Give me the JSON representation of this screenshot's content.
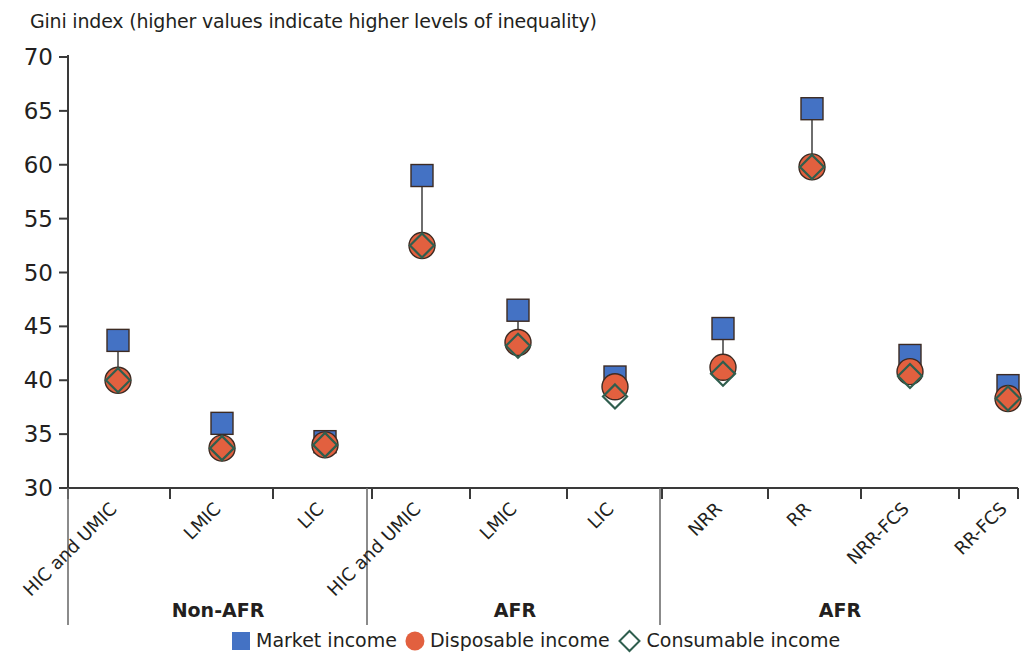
{
  "title": "Gini index (higher values indicate higher levels of inequality)",
  "legend": [
    {
      "label": "Market income",
      "marker": "square",
      "color": "#4472c4"
    },
    {
      "label": "Disposable income",
      "marker": "circle",
      "color": "#e2603f"
    },
    {
      "label": "Consumable income",
      "marker": "diamond",
      "color": "#ffffff"
    }
  ],
  "group_labels": [
    "Non-AFR",
    "AFR",
    "AFR"
  ],
  "axis": {
    "y_ticks": [
      "70",
      "65",
      "60",
      "55",
      "50",
      "45",
      "40",
      "35",
      "30"
    ],
    "y_min": 30,
    "y_max": 70
  },
  "chart_data": {
    "type": "scatter",
    "title": "Gini index (higher values indicate higher levels of inequality)",
    "xlabel": "",
    "ylabel": "Gini index",
    "ylim": [
      30,
      70
    ],
    "grid": false,
    "legend_position": "bottom",
    "categories": [
      "HIC and UMIC",
      "LMIC",
      "LIC",
      "HIC and UMIC",
      "LMIC",
      "LIC",
      "NRR",
      "RR",
      "NRR-FCS",
      "RR-FCS"
    ],
    "groups": [
      {
        "name": "Non-AFR",
        "categories": [
          "HIC and UMIC",
          "LMIC",
          "LIC"
        ]
      },
      {
        "name": "AFR",
        "categories": [
          "HIC and UMIC",
          "LMIC",
          "LIC"
        ]
      },
      {
        "name": "AFR",
        "categories": [
          "NRR",
          "RR",
          "NRR-FCS",
          "RR-FCS"
        ]
      }
    ],
    "series": [
      {
        "name": "Market income",
        "color": "#4472c4",
        "marker": "square",
        "values": [
          43.7,
          36.0,
          34.3,
          59.0,
          46.5,
          40.3,
          44.8,
          65.2,
          42.3,
          39.5
        ]
      },
      {
        "name": "Disposable income",
        "color": "#e2603f",
        "marker": "circle",
        "values": [
          40.0,
          33.7,
          34.0,
          52.5,
          43.5,
          39.4,
          41.2,
          59.8,
          40.8,
          38.3
        ]
      },
      {
        "name": "Consumable income",
        "color": "#ffffff",
        "marker": "diamond",
        "values": [
          40.0,
          33.7,
          34.0,
          52.5,
          43.2,
          38.5,
          40.6,
          59.8,
          40.4,
          38.3
        ]
      }
    ]
  }
}
